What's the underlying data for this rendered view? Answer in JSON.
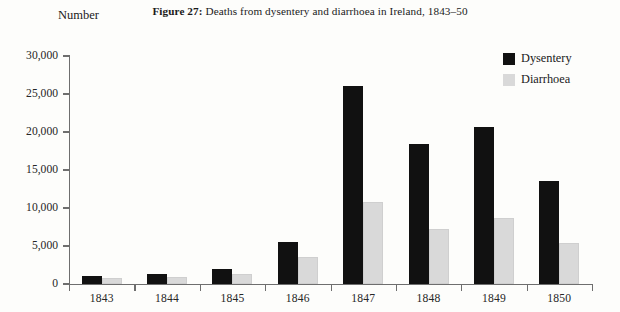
{
  "figure": {
    "label": "Figure 27:",
    "caption": "Deaths from dysentery and diarrhoea in Ireland, 1843–50",
    "y_axis_heading": "Number"
  },
  "legend": {
    "position": "top-right",
    "entries": [
      {
        "label": "Dysentery",
        "color": "#111111",
        "swatch": "filled-square-black"
      },
      {
        "label": "Diarrhoea",
        "color": "#d9d9d9",
        "swatch": "filled-square-grey"
      }
    ]
  },
  "axes": {
    "y_ticks": [
      "0",
      "5,000",
      "10,000",
      "15,000",
      "20,000",
      "25,000",
      "30,000"
    ],
    "x_ticks": [
      "1843",
      "1844",
      "1845",
      "1846",
      "1847",
      "1848",
      "1849",
      "1850"
    ]
  },
  "chart_data": {
    "type": "bar",
    "title": "Figure 27: Deaths from dysentery and diarrhoea in Ireland, 1843–50",
    "xlabel": "",
    "ylabel": "Number",
    "categories": [
      "1843",
      "1844",
      "1845",
      "1846",
      "1847",
      "1848",
      "1849",
      "1850"
    ],
    "series": [
      {
        "name": "Dysentery",
        "color": "#111111",
        "values": [
          1000,
          1300,
          2000,
          5500,
          26000,
          18400,
          20600,
          13600
        ]
      },
      {
        "name": "Diarrhoea",
        "color": "#d9d9d9",
        "values": [
          800,
          900,
          1300,
          3600,
          10800,
          7300,
          8700,
          5400
        ]
      }
    ],
    "ylim": [
      0,
      30000
    ],
    "ytick_values": [
      0,
      5000,
      10000,
      15000,
      20000,
      25000,
      30000
    ],
    "grid": false,
    "legend_position": "top-right"
  }
}
